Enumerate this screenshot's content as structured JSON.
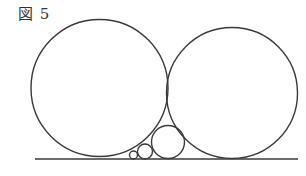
{
  "figure": {
    "caption": "図 5",
    "ground_line": {
      "x1": 35,
      "y1": 159,
      "x2": 298,
      "y2": 159
    },
    "circles": [
      {
        "name": "large-left-circle",
        "cx": 99.5,
        "cy": 88,
        "r": 68.5
      },
      {
        "name": "large-right-circle",
        "cx": 232,
        "cy": 93,
        "r": 65.5
      },
      {
        "name": "medium-circle",
        "cx": 168,
        "cy": 142,
        "r": 16.5
      },
      {
        "name": "small-circle",
        "cx": 145,
        "cy": 151.5,
        "r": 7.5
      },
      {
        "name": "tiny-circle",
        "cx": 133.5,
        "cy": 155,
        "r": 4
      }
    ],
    "stroke_color": "#3a3a3a"
  }
}
